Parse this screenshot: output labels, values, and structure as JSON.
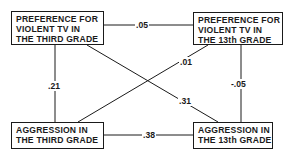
{
  "diagram": {
    "nodes": {
      "tv_third": {
        "lines": [
          "PREFERENCE FOR",
          "VIOLENT TV IN",
          "THE THIRD GRADE"
        ]
      },
      "tv_13th": {
        "lines": [
          "PREFERENCE FOR",
          "VIOLENT TV IN",
          "THE 13th GRADE"
        ]
      },
      "agg_third": {
        "lines": [
          "AGGRESSION IN",
          "THE THIRD GRADE"
        ]
      },
      "agg_13th": {
        "lines": [
          "AGGRESSION IN",
          "THE 13th GRADE"
        ]
      }
    },
    "edges": {
      "tv3_tv13": {
        "from": "tv_third",
        "to": "tv_13th",
        "value": ".05"
      },
      "tv3_agg3": {
        "from": "tv_third",
        "to": "agg_third",
        "value": ".21"
      },
      "tv13_agg13": {
        "from": "tv_13th",
        "to": "agg_13th",
        "value": "-.05"
      },
      "agg3_agg13": {
        "from": "agg_third",
        "to": "agg_13th",
        "value": ".38"
      },
      "tv3_agg13": {
        "from": "tv_third",
        "to": "agg_13th",
        "value": ".31"
      },
      "agg3_tv13": {
        "from": "agg_third",
        "to": "tv_13th",
        "value": ".01"
      }
    },
    "colors": {
      "line": "#1a1a1a",
      "background": "#ffffff"
    }
  }
}
